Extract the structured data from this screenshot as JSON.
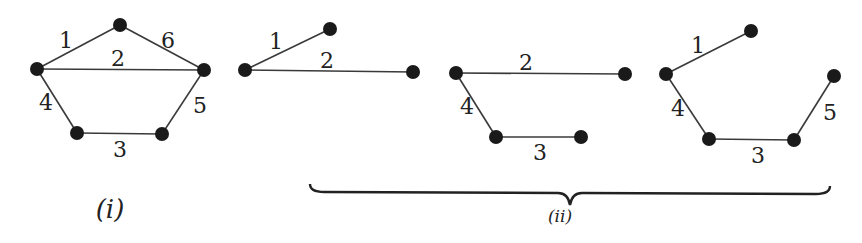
{
  "figure": {
    "graph_i": {
      "caption": "(i)",
      "nodes": [
        {
          "id": "a",
          "x": 37,
          "y": 69
        },
        {
          "id": "b",
          "x": 120,
          "y": 25
        },
        {
          "id": "c",
          "x": 204,
          "y": 70
        },
        {
          "id": "d",
          "x": 77,
          "y": 133
        },
        {
          "id": "e",
          "x": 162,
          "y": 134
        }
      ],
      "edges": [
        {
          "from": "a",
          "to": "b",
          "label": "1",
          "lx": 66,
          "ly": 48
        },
        {
          "from": "a",
          "to": "c",
          "label": "2",
          "lx": 118,
          "ly": 66
        },
        {
          "from": "d",
          "to": "e",
          "label": "3",
          "lx": 120,
          "ly": 157
        },
        {
          "from": "a",
          "to": "d",
          "label": "4",
          "lx": 46,
          "ly": 110
        },
        {
          "from": "c",
          "to": "e",
          "label": "5",
          "lx": 200,
          "ly": 113
        },
        {
          "from": "b",
          "to": "c",
          "label": "6",
          "lx": 168,
          "ly": 48
        }
      ]
    },
    "graph_ii_a": {
      "nodes": [
        {
          "id": "a",
          "x": 245,
          "y": 70
        },
        {
          "id": "b",
          "x": 330,
          "y": 29
        },
        {
          "id": "c",
          "x": 413,
          "y": 72
        }
      ],
      "edges": [
        {
          "from": "a",
          "to": "b",
          "label": "1",
          "lx": 276,
          "ly": 49
        },
        {
          "from": "a",
          "to": "c",
          "label": "2",
          "lx": 327,
          "ly": 68
        }
      ]
    },
    "graph_ii_b": {
      "nodes": [
        {
          "id": "a",
          "x": 456,
          "y": 73
        },
        {
          "id": "c",
          "x": 625,
          "y": 74
        },
        {
          "id": "d",
          "x": 496,
          "y": 137
        },
        {
          "id": "e",
          "x": 581,
          "y": 137
        }
      ],
      "edges": [
        {
          "from": "a",
          "to": "c",
          "label": "2",
          "lx": 526,
          "ly": 70
        },
        {
          "from": "d",
          "to": "e",
          "label": "3",
          "lx": 540,
          "ly": 160
        },
        {
          "from": "a",
          "to": "d",
          "label": "4",
          "lx": 467,
          "ly": 114
        }
      ]
    },
    "graph_ii_c": {
      "nodes": [
        {
          "id": "a",
          "x": 666,
          "y": 74
        },
        {
          "id": "b",
          "x": 751,
          "y": 31
        },
        {
          "id": "c",
          "x": 834,
          "y": 76
        },
        {
          "id": "d",
          "x": 709,
          "y": 139
        },
        {
          "id": "e",
          "x": 794,
          "y": 140
        }
      ],
      "edges": [
        {
          "from": "a",
          "to": "b",
          "label": "1",
          "lx": 698,
          "ly": 53
        },
        {
          "from": "d",
          "to": "e",
          "label": "3",
          "lx": 758,
          "ly": 163
        },
        {
          "from": "a",
          "to": "d",
          "label": "4",
          "lx": 678,
          "ly": 116
        },
        {
          "from": "c",
          "to": "e",
          "label": "5",
          "lx": 830,
          "ly": 120
        }
      ]
    },
    "group_ii": {
      "caption": "(ii)",
      "brace": {
        "x1": 310,
        "x2": 830,
        "y": 190,
        "tip_y": 205
      }
    }
  }
}
